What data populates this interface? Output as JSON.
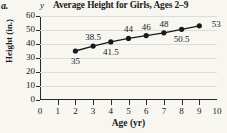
{
  "part_label": "a.",
  "y_variable": "y",
  "chart_data": {
    "type": "line",
    "title": "Average Height for Girls, Ages 2–9",
    "xlabel": "Age (yr)",
    "ylabel": "Height (in.)",
    "x": [
      2,
      3,
      4,
      5,
      6,
      7,
      8,
      9
    ],
    "values": [
      35,
      38.5,
      41.5,
      44,
      46,
      48,
      50.5,
      53
    ],
    "point_labels": [
      "35",
      "38.5",
      "41.5",
      "44",
      "46",
      "48",
      "50.5",
      "53"
    ],
    "point_label_positions": [
      "below",
      "above",
      "below",
      "above",
      "above",
      "above",
      "below",
      "right"
    ],
    "xlim": [
      0,
      10
    ],
    "ylim": [
      0,
      60
    ],
    "xticks": [
      0,
      1,
      2,
      3,
      4,
      5,
      6,
      7,
      8,
      9,
      10
    ],
    "xtick_labels": [
      "0",
      "1",
      "2",
      "3",
      "4",
      "5",
      "6",
      "7",
      "8",
      "9",
      "10"
    ],
    "yticks": [
      0,
      10,
      20,
      30,
      40,
      50,
      60
    ],
    "ytick_labels": [
      "0",
      "10",
      "20",
      "30",
      "40",
      "50",
      "60"
    ],
    "grid": true,
    "legend": false,
    "line_color": "#1a1a1a",
    "marker_color": "#1a1a1a",
    "grid_color": "#ddddd6",
    "background_color": "#f7f6f1"
  }
}
